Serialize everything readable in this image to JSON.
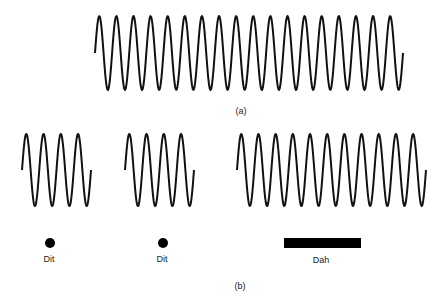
{
  "figure": {
    "background": "#ffffff",
    "stroke_color": "#111111",
    "stroke_width": 2,
    "part_a": {
      "label": "(a)",
      "label_pos": [
        241,
        106
      ],
      "wave": {
        "x_start": 95,
        "x_end": 403,
        "y_mid": 53,
        "amplitude": 37,
        "cycles": 18,
        "description": "continuous carrier"
      }
    },
    "part_b": {
      "label": "(b)",
      "label_pos": [
        240,
        281
      ],
      "bursts": [
        {
          "name": "dit-1",
          "x_start": 22,
          "x_end": 91,
          "y_mid": 170,
          "amplitude": 36,
          "cycles": 4
        },
        {
          "name": "dit-2",
          "x_start": 125,
          "x_end": 194,
          "y_mid": 170,
          "amplitude": 36,
          "cycles": 4
        },
        {
          "name": "dah",
          "x_start": 237,
          "x_end": 426,
          "y_mid": 170,
          "amplitude": 36,
          "cycles": 11
        }
      ],
      "symbols": [
        {
          "type": "dot",
          "label": "Dit",
          "cx": 50,
          "cy": 243,
          "r": 5,
          "label_pos": [
            49,
            254
          ]
        },
        {
          "type": "dot",
          "label": "Dit",
          "cx": 163,
          "cy": 243,
          "r": 5,
          "label_pos": [
            162,
            254
          ]
        },
        {
          "type": "bar",
          "label": "Dah",
          "x": 284,
          "y": 238,
          "w": 77,
          "h": 10,
          "label_pos": [
            321,
            255
          ]
        }
      ]
    }
  }
}
